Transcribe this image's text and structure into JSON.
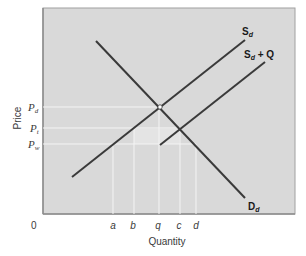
{
  "diagram": {
    "type": "supply-demand-import-quota",
    "axes": {
      "x_label": "Quantity",
      "y_label": "Price",
      "origin_label": "0"
    },
    "price_levels": [
      {
        "id": "pd",
        "main": "P",
        "sub": "d"
      },
      {
        "id": "pt",
        "main": "P",
        "sub": "t"
      },
      {
        "id": "pw",
        "main": "P",
        "sub": "w"
      }
    ],
    "quantity_ticks": [
      "a",
      "b",
      "q",
      "c",
      "d"
    ],
    "curves": [
      {
        "id": "sd",
        "main": "S",
        "sub": "d",
        "suffix": ""
      },
      {
        "id": "sdq",
        "main": "S",
        "sub": "d",
        "suffix": " + Q"
      },
      {
        "id": "dd",
        "main": "D",
        "sub": "d",
        "suffix": ""
      }
    ],
    "colors": {
      "plot_background": "#d9d9d9",
      "curve": "#3a3a3a",
      "guide_lines": "#f2f2f2",
      "frame": "#8c8c8c"
    }
  }
}
